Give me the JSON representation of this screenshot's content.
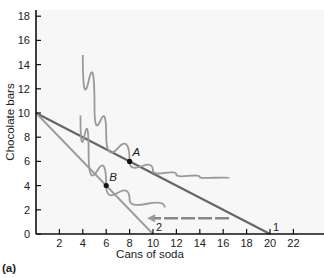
{
  "chart_data": {
    "type": "line",
    "title": "",
    "panel_label": "(a)",
    "xlabel": "Cans of soda",
    "ylabel": "Chocolate bars",
    "xlim": [
      0,
      24
    ],
    "ylim": [
      0,
      18
    ],
    "xticks": [
      2,
      4,
      6,
      8,
      10,
      12,
      14,
      16,
      18,
      20,
      22
    ],
    "yticks": [
      0,
      2,
      4,
      6,
      8,
      10,
      12,
      14,
      16,
      18
    ],
    "series": [
      {
        "name": "Budget line 1",
        "x": [
          0,
          20
        ],
        "y": [
          10,
          0
        ],
        "label": "1"
      },
      {
        "name": "Budget line 2",
        "x": [
          0,
          10
        ],
        "y": [
          10,
          0
        ],
        "label": "2"
      },
      {
        "name": "Indifference curve (through A)",
        "x": [
          4,
          5,
          6,
          8,
          10,
          12,
          14,
          16.5
        ],
        "y": [
          14.8,
          10.5,
          8.2,
          6,
          5.2,
          4.9,
          4.7,
          4.6
        ]
      },
      {
        "name": "Indifference curve (through B)",
        "x": [
          3.8,
          4.5,
          6,
          8,
          11
        ],
        "y": [
          9.8,
          6.5,
          4,
          2.8,
          2.2
        ]
      }
    ],
    "points": [
      {
        "label": "A",
        "x": 8,
        "y": 6
      },
      {
        "label": "B",
        "x": 6,
        "y": 4
      }
    ],
    "annotations": [
      {
        "type": "arrow",
        "from": [
          16.5,
          1.3
        ],
        "to": [
          9.5,
          1.3
        ],
        "style": "dashed, pointing left"
      }
    ],
    "grid": false,
    "legend": "none"
  }
}
